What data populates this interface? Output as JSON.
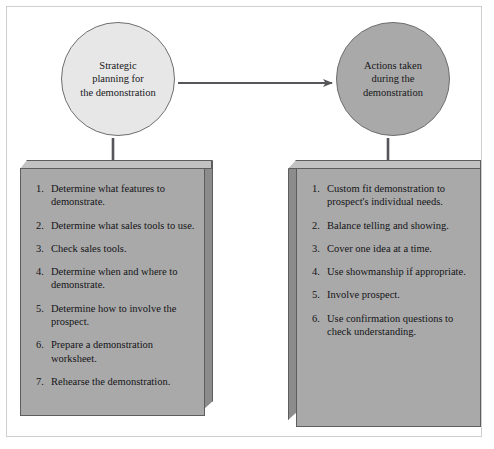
{
  "diagram": {
    "colors": {
      "circle_left_fill": "#e7e7e7",
      "circle_right_fill": "#a9a9a9",
      "slab_face_fill": "#a9a9a9",
      "slab_top_fill": "#c2c2c2",
      "slab_side_fill": "#8c8c8c",
      "outline": "#5d5d5d",
      "text": "#141417",
      "background": "#ffffff"
    },
    "nodes": {
      "left_circle": {
        "label": "Strategic\nplanning for\nthe demonstration"
      },
      "right_circle": {
        "label": "Actions taken\nduring the\ndemonstration"
      }
    },
    "connectors": [
      {
        "name": "circle-to-circle-arrow",
        "from": "left_circle",
        "to": "right_circle",
        "style": "arrow"
      },
      {
        "name": "left-circle-to-left-box",
        "from": "left_circle",
        "to": "left_box",
        "style": "line"
      },
      {
        "name": "right-circle-to-right-box",
        "from": "right_circle",
        "to": "right_box",
        "style": "line"
      }
    ],
    "left_box": {
      "items": [
        {
          "num": "1.",
          "text": "Determine what features to demonstrate."
        },
        {
          "num": "2.",
          "text": "Determine what sales tools to use."
        },
        {
          "num": "3.",
          "text": "Check sales tools."
        },
        {
          "num": "4.",
          "text": "Determine when and where to demonstrate."
        },
        {
          "num": "5.",
          "text": "Determine how to involve the prospect."
        },
        {
          "num": "6.",
          "text": "Prepare a demonstration worksheet."
        },
        {
          "num": "7.",
          "text": "Rehearse the demonstration."
        }
      ]
    },
    "right_box": {
      "items": [
        {
          "num": "1.",
          "text": "Custom fit demonstration to prospect's individual needs."
        },
        {
          "num": "2.",
          "text": "Balance telling and showing."
        },
        {
          "num": "3.",
          "text": "Cover one idea at a time."
        },
        {
          "num": "4.",
          "text": "Use showmanship if appropriate."
        },
        {
          "num": "5.",
          "text": "Involve prospect."
        },
        {
          "num": "6.",
          "text": "Use confirmation questions to check understanding."
        }
      ]
    }
  }
}
